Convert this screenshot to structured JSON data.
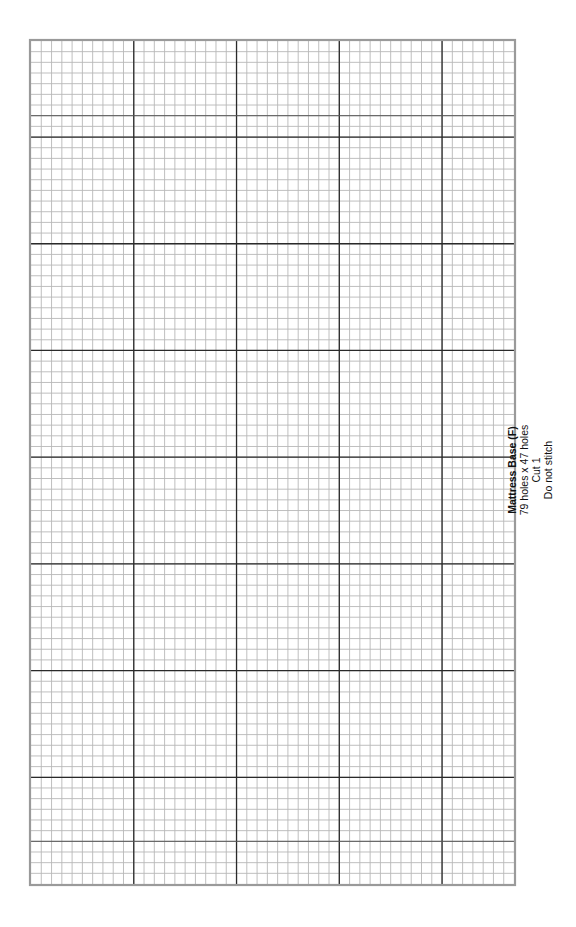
{
  "pattern": {
    "title": "Mattress Base (F)",
    "dimensions": "79 holes x 47 holes",
    "cut": "Cut 1",
    "stitch_note": "Do not stitch"
  },
  "grid": {
    "columns": 47,
    "rows": 79,
    "border_color": "#9a9a9a",
    "minor_line_color": "#b8b8b8",
    "major_line_color": "#2a2a2a",
    "semi_major_line_color": "#555555"
  }
}
